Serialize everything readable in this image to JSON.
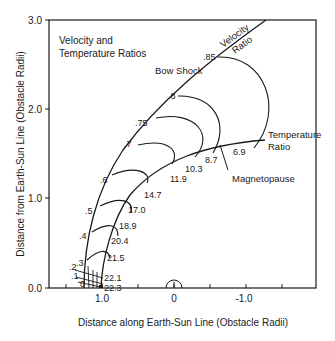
{
  "title_lines": [
    "Velocity and",
    "Temperature Ratios"
  ],
  "axes": {
    "xlabel": "Distance along Earth-Sun Line (Obstacle Radii)",
    "ylabel": "Distance from Earth-Sun Line (Obstacle Radii)",
    "x_ticks": [
      "1.0",
      "0",
      "-1.0"
    ],
    "y_ticks": [
      "0.0",
      "1.0",
      "2.0",
      "3.0"
    ]
  },
  "curves": {
    "bow_shock": "Bow Shock",
    "velocity_ratio": [
      "Velocity",
      "Ratio"
    ],
    "temperature_ratio": [
      "Temperature",
      "Ratio"
    ],
    "magnetopause": "Magnetopause"
  },
  "velocity_labels": [
    "0",
    ".1",
    ".2",
    ".3",
    ".4",
    ".5",
    ".6",
    ".7",
    ".75",
    ".8",
    ".85"
  ],
  "temperature_labels": [
    "22.3",
    "22.1",
    "21.5",
    "20.4",
    "18.9",
    "17.0",
    "14.7",
    "11.9",
    "10.3",
    "8.7",
    "6.9"
  ],
  "colors": {
    "ink": "#1a1a1a",
    "background": "#ffffff"
  }
}
